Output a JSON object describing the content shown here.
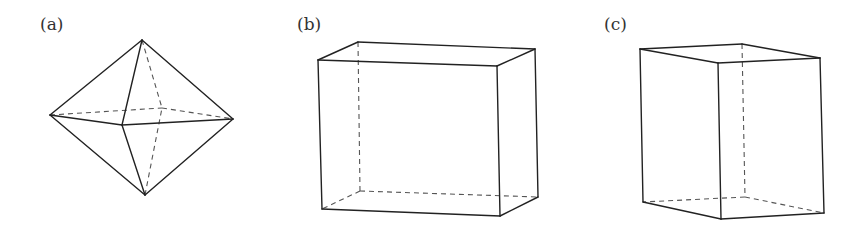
{
  "figures": [
    {
      "label": "(a)",
      "shape": "octahedron",
      "label_pos": [
        40,
        14
      ],
      "vertices": {
        "top": [
          142,
          40
        ],
        "left": [
          50,
          115
        ],
        "right": [
          233,
          119
        ],
        "bottom": [
          145,
          195
        ],
        "front": [
          122,
          125
        ],
        "back": [
          162,
          108
        ]
      },
      "solid_edges": [
        [
          "top",
          "left"
        ],
        [
          "top",
          "right"
        ],
        [
          "top",
          "front"
        ],
        [
          "left",
          "front"
        ],
        [
          "front",
          "right"
        ],
        [
          "bottom",
          "left"
        ],
        [
          "bottom",
          "right"
        ],
        [
          "bottom",
          "front"
        ]
      ],
      "dashed_edges": [
        [
          "top",
          "back"
        ],
        [
          "left",
          "back"
        ],
        [
          "back",
          "right"
        ],
        [
          "bottom",
          "back"
        ]
      ]
    },
    {
      "label": "(b)",
      "shape": "rectangular box (wide)",
      "label_pos": [
        297,
        14
      ],
      "vertices": {
        "ftl": [
          318,
          60
        ],
        "ftr": [
          497,
          66
        ],
        "fbr": [
          500,
          216
        ],
        "fbl": [
          322,
          209
        ],
        "btl": [
          358,
          42
        ],
        "btr": [
          535,
          49
        ],
        "bbr": [
          538,
          197
        ],
        "bbl": [
          360,
          191
        ]
      },
      "solid_edges": [
        [
          "ftl",
          "ftr"
        ],
        [
          "ftr",
          "fbr"
        ],
        [
          "fbr",
          "fbl"
        ],
        [
          "fbl",
          "ftl"
        ],
        [
          "ftl",
          "btl"
        ],
        [
          "btl",
          "btr"
        ],
        [
          "btr",
          "ftr"
        ],
        [
          "btr",
          "bbr"
        ],
        [
          "bbr",
          "fbr"
        ]
      ],
      "dashed_edges": [
        [
          "btl",
          "bbl"
        ],
        [
          "bbl",
          "bbr"
        ],
        [
          "bbl",
          "fbl"
        ]
      ]
    },
    {
      "label": "(c)",
      "shape": "rectangular box (tall, rotated)",
      "label_pos": [
        604,
        14
      ],
      "vertices": {
        "tl": [
          640,
          49
        ],
        "tf": [
          718,
          63
        ],
        "tr": [
          820,
          58
        ],
        "tb": [
          742,
          44
        ],
        "bl": [
          643,
          202
        ],
        "bf": [
          721,
          219
        ],
        "br": [
          824,
          213
        ],
        "bb": [
          745,
          197
        ]
      },
      "solid_edges": [
        [
          "tl",
          "tf"
        ],
        [
          "tf",
          "tr"
        ],
        [
          "tr",
          "tb"
        ],
        [
          "tb",
          "tl"
        ],
        [
          "tl",
          "bl"
        ],
        [
          "tf",
          "bf"
        ],
        [
          "tr",
          "br"
        ],
        [
          "bl",
          "bf"
        ],
        [
          "bf",
          "br"
        ]
      ],
      "dashed_edges": [
        [
          "tb",
          "bb"
        ],
        [
          "bb",
          "bl"
        ],
        [
          "bb",
          "br"
        ]
      ]
    }
  ]
}
